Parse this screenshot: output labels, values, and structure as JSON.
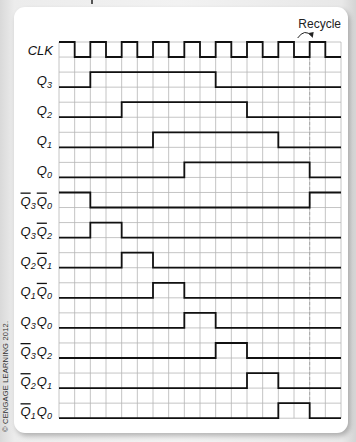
{
  "diagram": {
    "title_fragment": "",
    "annotation": "Recycle",
    "copyright": "© CENGAGE LEARNING 2012.",
    "grid": {
      "columns": 18,
      "rows": 13,
      "recycle_column": 16
    },
    "colors": {
      "grid": "#b5b5b5",
      "signal": "#111111",
      "dashed": "#aaaaaa",
      "card": "#ffffff"
    }
  },
  "signals": [
    {
      "name": "CLK",
      "label": "CLK",
      "parts": [
        [
          "CLK",
          "",
          false
        ]
      ],
      "type": "clock"
    },
    {
      "name": "Q3",
      "label": "Q3",
      "parts": [
        [
          "Q",
          "3",
          false
        ]
      ],
      "high": [
        [
          2,
          10
        ]
      ]
    },
    {
      "name": "Q2",
      "label": "Q2",
      "parts": [
        [
          "Q",
          "2",
          false
        ]
      ],
      "high": [
        [
          4,
          12
        ]
      ]
    },
    {
      "name": "Q1",
      "label": "Q1",
      "parts": [
        [
          "Q",
          "1",
          false
        ]
      ],
      "high": [
        [
          6,
          14
        ]
      ]
    },
    {
      "name": "Q0",
      "label": "Q0",
      "parts": [
        [
          "Q",
          "0",
          false
        ]
      ],
      "high": [
        [
          8,
          16
        ]
      ]
    },
    {
      "name": "nQ3nQ0",
      "label": "Q̄3Q̄0",
      "parts": [
        [
          "Q",
          "3",
          true
        ],
        [
          "Q",
          "0",
          true
        ]
      ],
      "high": [
        [
          0,
          2
        ],
        [
          16,
          18
        ]
      ]
    },
    {
      "name": "Q3nQ2",
      "label": "Q3Q̄2",
      "parts": [
        [
          "Q",
          "3",
          false
        ],
        [
          "Q",
          "2",
          true
        ]
      ],
      "high": [
        [
          2,
          4
        ]
      ]
    },
    {
      "name": "Q2nQ1",
      "label": "Q2Q̄1",
      "parts": [
        [
          "Q",
          "2",
          false
        ],
        [
          "Q",
          "1",
          true
        ]
      ],
      "high": [
        [
          4,
          6
        ]
      ]
    },
    {
      "name": "Q1nQ0",
      "label": "Q1Q̄0",
      "parts": [
        [
          "Q",
          "1",
          false
        ],
        [
          "Q",
          "0",
          true
        ]
      ],
      "high": [
        [
          6,
          8
        ]
      ]
    },
    {
      "name": "Q3Q0",
      "label": "Q3Q0",
      "parts": [
        [
          "Q",
          "3",
          false
        ],
        [
          "Q",
          "0",
          false
        ]
      ],
      "high": [
        [
          8,
          10
        ]
      ]
    },
    {
      "name": "nQ3Q2",
      "label": "Q̄3Q2",
      "parts": [
        [
          "Q",
          "3",
          true
        ],
        [
          "Q",
          "2",
          false
        ]
      ],
      "high": [
        [
          10,
          12
        ]
      ]
    },
    {
      "name": "nQ2Q1",
      "label": "Q̄2Q1",
      "parts": [
        [
          "Q",
          "2",
          true
        ],
        [
          "Q",
          "1",
          false
        ]
      ],
      "high": [
        [
          12,
          14
        ]
      ]
    },
    {
      "name": "nQ1Q0",
      "label": "Q̄1Q0",
      "parts": [
        [
          "Q",
          "1",
          true
        ],
        [
          "Q",
          "0",
          false
        ]
      ],
      "high": [
        [
          14,
          16
        ]
      ]
    }
  ]
}
